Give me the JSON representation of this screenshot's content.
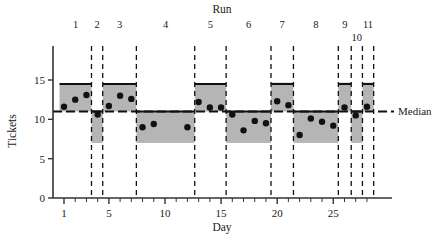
{
  "chart_data": {
    "type": "scatter",
    "title": "",
    "xlabel": "Day",
    "ylabel": "Tickets",
    "top_axis_label": "Run",
    "xlim": [
      0.1,
      28.9
    ],
    "ylim": [
      0,
      17.2
    ],
    "yticks": [
      0,
      5,
      10,
      15
    ],
    "ytick_labels": [
      "0",
      "5",
      "10",
      "15"
    ],
    "xticks": [
      1,
      5,
      10,
      15,
      20,
      25
    ],
    "xtick_labels": [
      "1",
      "5",
      "10",
      "15",
      "20",
      "25"
    ],
    "xticks_minor": [
      2,
      3,
      4,
      6,
      7,
      8,
      9,
      11,
      12,
      13,
      14,
      16,
      17,
      18,
      19,
      21,
      22,
      23,
      24,
      26,
      27,
      28
    ],
    "grid": false,
    "median": 11,
    "median_label": "Median",
    "band_upper": 14.5,
    "band_lower": 7,
    "band_color": "#a8a8a8",
    "band_opacity": 0.85,
    "point_color": "#111111",
    "dash_color": "#111111",
    "series_name": "Tickets per day",
    "points": [
      {
        "day": 1,
        "tickets": 11.6,
        "run": 1
      },
      {
        "day": 2,
        "tickets": 12.5,
        "run": 1
      },
      {
        "day": 3,
        "tickets": 13.1,
        "run": 1
      },
      {
        "day": 4,
        "tickets": 10.6,
        "run": 2
      },
      {
        "day": 5,
        "tickets": 11.7,
        "run": 3
      },
      {
        "day": 6,
        "tickets": 13.0,
        "run": 3
      },
      {
        "day": 7,
        "tickets": 12.6,
        "run": 3
      },
      {
        "day": 8,
        "tickets": 9.0,
        "run": 4
      },
      {
        "day": 9,
        "tickets": 9.4,
        "run": 4
      },
      {
        "day": 12,
        "tickets": 9.0,
        "run": 4
      },
      {
        "day": 13,
        "tickets": 12.2,
        "run": 5
      },
      {
        "day": 14,
        "tickets": 11.5,
        "run": 5
      },
      {
        "day": 15,
        "tickets": 11.5,
        "run": 5
      },
      {
        "day": 16,
        "tickets": 10.6,
        "run": 6
      },
      {
        "day": 17,
        "tickets": 8.6,
        "run": 6
      },
      {
        "day": 18,
        "tickets": 9.8,
        "run": 6
      },
      {
        "day": 19,
        "tickets": 9.5,
        "run": 6
      },
      {
        "day": 20,
        "tickets": 12.3,
        "run": 7
      },
      {
        "day": 21,
        "tickets": 11.8,
        "run": 7
      },
      {
        "day": 22,
        "tickets": 8.0,
        "run": 8
      },
      {
        "day": 23,
        "tickets": 10.1,
        "run": 8
      },
      {
        "day": 24,
        "tickets": 9.7,
        "run": 8
      },
      {
        "day": 25,
        "tickets": 9.2,
        "run": 8
      },
      {
        "day": 26,
        "tickets": 11.5,
        "run": 9
      },
      {
        "day": 27,
        "tickets": 10.5,
        "run": 10
      },
      {
        "day": 28,
        "tickets": 11.6,
        "run": 11
      }
    ],
    "runs": [
      {
        "label": "1",
        "start": 0.6,
        "end": 3.45,
        "side": "above",
        "label_row": 0
      },
      {
        "label": "2",
        "start": 3.45,
        "end": 4.45,
        "side": "below",
        "label_row": 0
      },
      {
        "label": "3",
        "start": 4.45,
        "end": 7.45,
        "side": "above",
        "label_row": 0
      },
      {
        "label": "4",
        "start": 7.45,
        "end": 12.65,
        "side": "below",
        "label_row": 0
      },
      {
        "label": "5",
        "start": 12.65,
        "end": 15.45,
        "side": "above",
        "label_row": 0
      },
      {
        "label": "6",
        "start": 15.45,
        "end": 19.45,
        "side": "below",
        "label_row": 0
      },
      {
        "label": "7",
        "start": 19.45,
        "end": 21.45,
        "side": "above",
        "label_row": 0
      },
      {
        "label": "8",
        "start": 21.45,
        "end": 25.45,
        "side": "below",
        "label_row": 0
      },
      {
        "label": "9",
        "start": 25.45,
        "end": 26.6,
        "side": "above",
        "label_row": 0
      },
      {
        "label": "10",
        "start": 26.6,
        "end": 27.6,
        "side": "below",
        "label_row": 1
      },
      {
        "label": "11",
        "start": 27.6,
        "end": 28.6,
        "side": "above",
        "label_row": 0
      }
    ]
  }
}
